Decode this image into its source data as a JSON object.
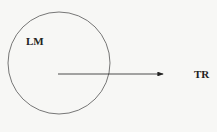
{
  "diagram": {
    "circle": {
      "label": "LM",
      "cx": 59,
      "cy": 63,
      "r": 51,
      "stroke": "#555555"
    },
    "arrow": {
      "x1": 58,
      "y1": 74,
      "x2": 163,
      "y2": 74,
      "stroke": "#222222"
    },
    "target": {
      "label": "TR"
    }
  }
}
